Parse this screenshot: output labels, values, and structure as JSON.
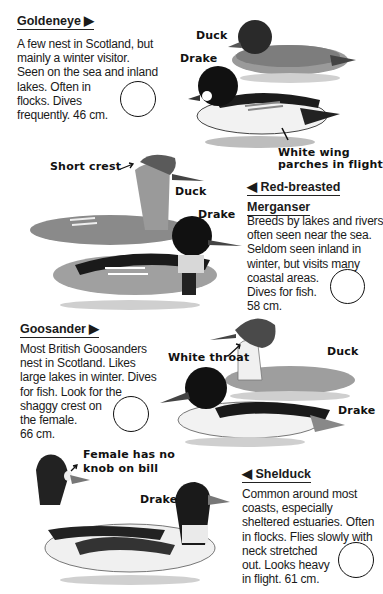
{
  "entries": [
    {
      "id": "goldeneye",
      "heading": "Goldeneye ▶",
      "description": [
        "A few nest in Scotland, but",
        "mainly a winter visitor.",
        "Seen on the sea and inland",
        "lakes. Often in",
        "flocks. Dives",
        "frequently. 46 cm."
      ],
      "labels": {
        "duck": "Duck",
        "drake": "Drake",
        "note1": "White wing",
        "note2": "parches in flight"
      }
    },
    {
      "id": "red-breasted-merganser",
      "heading_line1": "◀ Red-breasted",
      "heading_line2": "Merganser",
      "description": [
        "Breeds by lakes and rivers",
        "often seen near the sea.",
        "Seldom seen inland in",
        "winter, but visits many",
        "coastal areas.",
        "Dives for fish.",
        "58 cm."
      ],
      "labels": {
        "crest": "Short crest",
        "duck": "Duck",
        "drake": "Drake"
      }
    },
    {
      "id": "goosander",
      "heading": "Goosander ▶",
      "description": [
        "Most British Goosanders",
        "nest in Scotland. Likes",
        "large lakes in winter. Dives",
        "for fish. Look for the",
        "shaggy crest on",
        "the female.",
        "66 cm."
      ],
      "labels": {
        "throat": "White throat",
        "duck": "Duck",
        "drake": "Drake"
      }
    },
    {
      "id": "shelduck",
      "heading": "◀ Shelduck",
      "description": [
        "Common around most",
        "coasts, especially",
        "sheltered estuaries. Often",
        "in flocks. Flies slowly with",
        "neck stretched",
        "out. Looks heavy",
        "in flight. 61 cm."
      ],
      "labels": {
        "female1": "Female has no",
        "female2": "knob on bill",
        "drake": "Drake"
      }
    }
  ]
}
